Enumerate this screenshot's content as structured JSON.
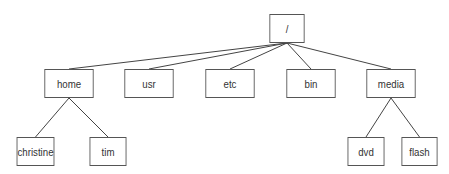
{
  "diagram": {
    "type": "directory-tree",
    "colors": {
      "line": "#444444",
      "border": "#555555",
      "text": "#333333",
      "background": "#ffffff"
    },
    "nodes": {
      "root": {
        "label": "/",
        "x": 267,
        "y": 14,
        "w": 40,
        "h": 29
      },
      "home": {
        "label": "home",
        "x": 41,
        "y": 69,
        "w": 56,
        "h": 29
      },
      "usr": {
        "label": "usr",
        "x": 121,
        "y": 69,
        "w": 56,
        "h": 29
      },
      "etc": {
        "label": "etc",
        "x": 202,
        "y": 69,
        "w": 56,
        "h": 29
      },
      "bin": {
        "label": "bin",
        "x": 283,
        "y": 69,
        "w": 56,
        "h": 29
      },
      "media": {
        "label": "media",
        "x": 363,
        "y": 69,
        "w": 56,
        "h": 29
      },
      "christine": {
        "label": "christine",
        "x": 14,
        "y": 137,
        "w": 43,
        "h": 29
      },
      "tim": {
        "label": "tim",
        "x": 87,
        "y": 137,
        "w": 42,
        "h": 29
      },
      "dvd": {
        "label": "dvd",
        "x": 345,
        "y": 137,
        "w": 42,
        "h": 29
      },
      "flash": {
        "label": "flash",
        "x": 399,
        "y": 137,
        "w": 41,
        "h": 29
      }
    },
    "edges": [
      [
        "root",
        "home"
      ],
      [
        "root",
        "usr"
      ],
      [
        "root",
        "etc"
      ],
      [
        "root",
        "bin"
      ],
      [
        "root",
        "media"
      ],
      [
        "home",
        "christine"
      ],
      [
        "home",
        "tim"
      ],
      [
        "media",
        "dvd"
      ],
      [
        "media",
        "flash"
      ]
    ]
  }
}
